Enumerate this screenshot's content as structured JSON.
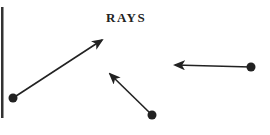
{
  "title": "RAYS",
  "colors": {
    "ink": "#222222",
    "background": "#ffffff"
  },
  "rays": [
    {
      "id": "ray-1",
      "endpoint": [
        13,
        98
      ],
      "toward": [
        102,
        40
      ]
    },
    {
      "id": "ray-2",
      "endpoint": [
        152,
        115
      ],
      "toward": [
        110,
        74
      ]
    },
    {
      "id": "ray-3",
      "endpoint": [
        251,
        67
      ],
      "toward": [
        175,
        65
      ]
    }
  ]
}
